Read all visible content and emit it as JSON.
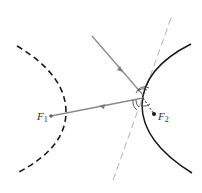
{
  "diagram": {
    "type": "hyperbola-reflection",
    "colors": {
      "curve": "#1a1a1a",
      "ray": "#8a8a8a",
      "tangent": "#a0a0a0",
      "focus": "#555555",
      "label": "#333333"
    },
    "labels": {
      "f1": {
        "main": "F",
        "sub": "1"
      },
      "f2": {
        "main": "F",
        "sub": "2"
      }
    },
    "points": {
      "F1": [
        51,
        116
      ],
      "F2": [
        154,
        114
      ],
      "P": [
        143,
        97
      ]
    }
  }
}
